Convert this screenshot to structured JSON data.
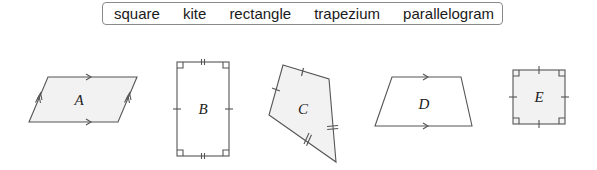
{
  "word_bank": {
    "words": [
      "square",
      "kite",
      "rectangle",
      "trapezium",
      "parallelogram"
    ]
  },
  "shapes": [
    {
      "label": "A",
      "type": "parallelogram",
      "fill": "#f2f2f2",
      "marks": "parallel arrows (single on horizontal sides, double on slanted sides)"
    },
    {
      "label": "B",
      "type": "rectangle",
      "fill": "#ffffff",
      "marks": "right angles at 4 corners, single ticks on long sides, double ticks on short sides"
    },
    {
      "label": "C",
      "type": "kite",
      "fill": "#f2f2f2",
      "marks": "single ticks on two upper sides, double ticks on two lower sides"
    },
    {
      "label": "D",
      "type": "trapezium",
      "fill": "#ffffff",
      "marks": "single parallel arrows on top and bottom sides"
    },
    {
      "label": "E",
      "type": "square",
      "fill": "#f2f2f2",
      "marks": "right angles at 4 corners, single ticks on all sides"
    }
  ],
  "colors": {
    "stroke": "#555555",
    "shaded_fill": "#f2f2f2",
    "box_border": "#8a8a8a"
  }
}
